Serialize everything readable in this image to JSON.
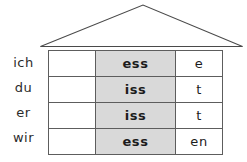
{
  "diagram": {
    "roof": {
      "icon": "house-roof-triangle",
      "stroke_color": "#4a4a4a"
    },
    "colors": {
      "stem_column_fill": "#d9d9d9",
      "cell_border": "#5d5d5d",
      "text": "#1c1c1c",
      "pronoun_text": "#2b2b2b",
      "background": "#ffffff"
    },
    "columns": [
      {
        "key": "blank",
        "header": ""
      },
      {
        "key": "stem",
        "header": ""
      },
      {
        "key": "ending",
        "header": ""
      }
    ],
    "rows": [
      {
        "pronoun": "ich",
        "blank": "",
        "stem": "ess",
        "ending": "e"
      },
      {
        "pronoun": "du",
        "blank": "",
        "stem": "iss",
        "ending": "t"
      },
      {
        "pronoun": "er",
        "blank": "",
        "stem": "iss",
        "ending": "t"
      },
      {
        "pronoun": "wir",
        "blank": "",
        "stem": "ess",
        "ending": "en"
      }
    ]
  }
}
